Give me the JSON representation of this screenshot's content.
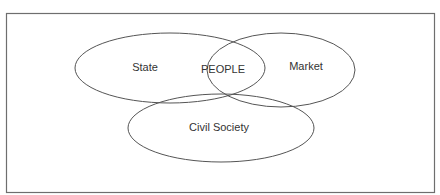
{
  "diagram": {
    "frame": {
      "stroke": "#6e6e6e"
    },
    "ellipses": [
      {
        "id": "state",
        "label": "State",
        "cx": 170,
        "cy": 68,
        "rx": 95,
        "ry": 35,
        "label_x": 145,
        "label_y": 68
      },
      {
        "id": "market",
        "label": "Market",
        "cx": 281,
        "cy": 70,
        "rx": 74,
        "ry": 37,
        "label_x": 306,
        "label_y": 67
      },
      {
        "id": "civil-society",
        "label": "Civil Society",
        "cx": 221,
        "cy": 128,
        "rx": 93,
        "ry": 34,
        "label_x": 219,
        "label_y": 128
      }
    ],
    "center_label": "PEOPLE",
    "stroke_color": "#555555",
    "text_color": "#333333"
  }
}
